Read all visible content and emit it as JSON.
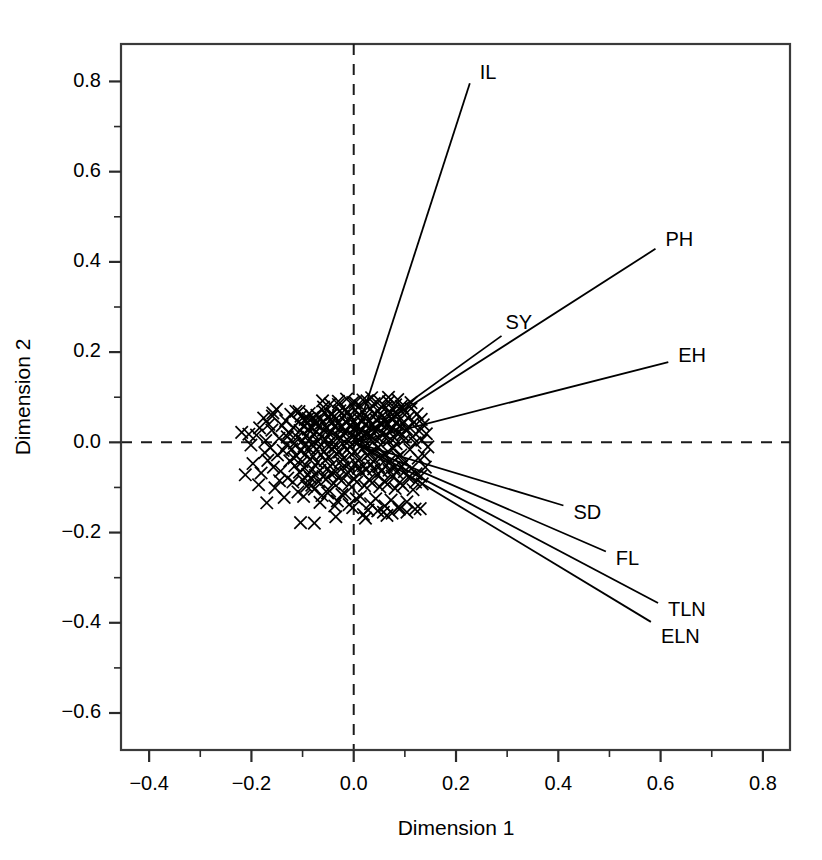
{
  "chart_data": {
    "type": "scatter",
    "title": "",
    "subtitle": "",
    "xlabel": "Dimension 1",
    "ylabel": "Dimension 2",
    "xlim": [
      -0.455,
      0.853
    ],
    "ylim": [
      -0.682,
      0.883
    ],
    "xticks": [
      -0.4,
      -0.2,
      0.0,
      0.2,
      0.4,
      0.6,
      0.8
    ],
    "xticklabels": [
      "-0.4",
      "-0.2",
      "0.0",
      "0.2",
      "0.4",
      "0.6",
      "0.8"
    ],
    "yticks": [
      -0.6,
      -0.4,
      -0.2,
      0.0,
      0.2,
      0.4,
      0.6,
      0.8
    ],
    "yticklabels": [
      "-0.6",
      "-0.4",
      "-0.2",
      "0.0",
      "0.2",
      "0.4",
      "0.6",
      "0.8"
    ],
    "xminorticks": [
      -0.3,
      -0.1,
      0.1,
      0.3,
      0.5,
      0.7
    ],
    "yminorticks": [
      -0.5,
      -0.3,
      -0.1,
      0.1,
      0.3,
      0.5,
      0.7
    ],
    "grid": false,
    "legend": "none",
    "reference_lines": [
      {
        "orientation": "horizontal",
        "value": 0.0,
        "style": "dashed"
      },
      {
        "orientation": "vertical",
        "value": 0.0,
        "style": "dashed"
      }
    ],
    "point_marker": "x",
    "point_color": "#000000",
    "vector_color": "#000000",
    "vectors": [
      {
        "name": "IL",
        "x": 0.227,
        "y": 0.796,
        "label_dx": 10,
        "label_dy": -10
      },
      {
        "name": "PH",
        "x": 0.59,
        "y": 0.429,
        "label_dx": 10,
        "label_dy": -8
      },
      {
        "name": "SY",
        "x": 0.289,
        "y": 0.236,
        "label_dx": 4,
        "label_dy": -12
      },
      {
        "name": "EH",
        "x": 0.615,
        "y": 0.178,
        "label_dx": 10,
        "label_dy": -5
      },
      {
        "name": "SD",
        "x": 0.41,
        "y": -0.14,
        "label_dx": 10,
        "label_dy": 8
      },
      {
        "name": "FL",
        "x": 0.493,
        "y": -0.242,
        "label_dx": 10,
        "label_dy": 8
      },
      {
        "name": "TLN",
        "x": 0.595,
        "y": -0.356,
        "label_dx": 10,
        "label_dy": 8
      },
      {
        "name": "ELN",
        "x": 0.581,
        "y": -0.398,
        "label_dx": 10,
        "label_dy": 16
      }
    ],
    "points": [
      [
        -0.219,
        0.022
      ],
      [
        -0.212,
        -0.072
      ],
      [
        -0.205,
        0.018
      ],
      [
        -0.197,
        -0.047
      ],
      [
        -0.19,
        0.016
      ],
      [
        -0.186,
        -0.094
      ],
      [
        -0.181,
        -0.068
      ],
      [
        -0.176,
        0.054
      ],
      [
        -0.174,
        -0.023
      ],
      [
        -0.17,
        -0.134
      ],
      [
        -0.166,
        0.04
      ],
      [
        -0.163,
        -0.012
      ],
      [
        -0.16,
        0.027
      ],
      [
        -0.157,
        -0.055
      ],
      [
        -0.154,
        -0.101
      ],
      [
        -0.151,
        0.073
      ],
      [
        -0.149,
        -0.028
      ],
      [
        -0.146,
        0.009
      ],
      [
        -0.143,
        -0.064
      ],
      [
        -0.14,
        0.037
      ],
      [
        -0.138,
        -0.018
      ],
      [
        -0.136,
        -0.122
      ],
      [
        -0.133,
        0.048
      ],
      [
        -0.131,
        -0.005
      ],
      [
        -0.129,
        -0.079
      ],
      [
        -0.127,
        0.021
      ],
      [
        -0.125,
        -0.041
      ],
      [
        -0.123,
        0.062
      ],
      [
        -0.121,
        -0.015
      ],
      [
        -0.119,
        -0.088
      ],
      [
        -0.118,
        0.033
      ],
      [
        -0.116,
        -0.002
      ],
      [
        -0.115,
        -0.052
      ],
      [
        -0.113,
        0.069
      ],
      [
        -0.112,
        -0.03
      ],
      [
        -0.11,
        0.011
      ],
      [
        -0.109,
        -0.11
      ],
      [
        -0.108,
        0.045
      ],
      [
        -0.106,
        -0.066
      ],
      [
        -0.105,
        0.026
      ],
      [
        -0.104,
        -0.019
      ],
      [
        -0.103,
        0.058
      ],
      [
        -0.101,
        -0.043
      ],
      [
        -0.1,
        0.004
      ],
      [
        -0.099,
        -0.084
      ],
      [
        -0.098,
        0.036
      ],
      [
        -0.097,
        -0.008
      ],
      [
        -0.096,
        -0.057
      ],
      [
        -0.095,
        0.051
      ],
      [
        -0.094,
        -0.026
      ],
      [
        -0.093,
        0.015
      ],
      [
        -0.092,
        -0.097
      ],
      [
        -0.091,
        0.042
      ],
      [
        -0.09,
        -0.071
      ],
      [
        -0.089,
        0.029
      ],
      [
        -0.088,
        -0.013
      ],
      [
        -0.087,
        0.064
      ],
      [
        -0.086,
        -0.038
      ],
      [
        -0.085,
        0.007
      ],
      [
        -0.084,
        -0.079
      ],
      [
        -0.083,
        0.033
      ],
      [
        -0.082,
        -0.004
      ],
      [
        -0.081,
        -0.06
      ],
      [
        -0.08,
        0.055
      ],
      [
        -0.079,
        -0.031
      ],
      [
        -0.078,
        0.018
      ],
      [
        -0.077,
        -0.104
      ],
      [
        -0.076,
        0.047
      ],
      [
        -0.075,
        -0.073
      ],
      [
        -0.074,
        0.024
      ],
      [
        -0.073,
        -0.016
      ],
      [
        -0.072,
        0.06
      ],
      [
        -0.071,
        -0.045
      ],
      [
        -0.07,
        0.002
      ],
      [
        -0.069,
        -0.087
      ],
      [
        -0.068,
        0.038
      ],
      [
        -0.067,
        -0.01
      ],
      [
        -0.066,
        -0.062
      ],
      [
        -0.065,
        0.053
      ],
      [
        -0.064,
        -0.028
      ],
      [
        -0.063,
        0.013
      ],
      [
        -0.062,
        -0.118
      ],
      [
        -0.061,
        0.044
      ],
      [
        -0.06,
        -0.076
      ],
      [
        -0.059,
        0.027
      ],
      [
        -0.058,
        -0.02
      ],
      [
        -0.057,
        0.067
      ],
      [
        -0.056,
        -0.04
      ],
      [
        -0.055,
        0.006
      ],
      [
        -0.054,
        -0.082
      ],
      [
        -0.053,
        0.031
      ],
      [
        -0.052,
        -0.006
      ],
      [
        -0.051,
        -0.058
      ],
      [
        -0.05,
        0.057
      ],
      [
        -0.049,
        -0.033
      ],
      [
        -0.048,
        0.02
      ],
      [
        -0.047,
        -0.108
      ],
      [
        -0.046,
        0.049
      ],
      [
        -0.045,
        -0.069
      ],
      [
        -0.044,
        0.023
      ],
      [
        -0.043,
        -0.014
      ],
      [
        -0.042,
        0.063
      ],
      [
        -0.041,
        -0.048
      ],
      [
        -0.04,
        0.0
      ],
      [
        -0.039,
        -0.091
      ],
      [
        -0.038,
        0.035
      ],
      [
        -0.037,
        -0.011
      ],
      [
        -0.036,
        -0.065
      ],
      [
        -0.035,
        0.052
      ],
      [
        -0.034,
        -0.025
      ],
      [
        -0.033,
        0.016
      ],
      [
        -0.032,
        -0.13
      ],
      [
        -0.031,
        0.041
      ],
      [
        -0.03,
        -0.078
      ],
      [
        -0.029,
        0.029
      ],
      [
        -0.028,
        -0.022
      ],
      [
        -0.027,
        0.07
      ],
      [
        -0.026,
        -0.043
      ],
      [
        -0.025,
        0.009
      ],
      [
        -0.024,
        -0.085
      ],
      [
        -0.023,
        0.034
      ],
      [
        -0.022,
        -0.003
      ],
      [
        -0.021,
        -0.055
      ],
      [
        -0.02,
        0.059
      ],
      [
        -0.019,
        -0.035
      ],
      [
        -0.018,
        0.022
      ],
      [
        -0.017,
        -0.114
      ],
      [
        -0.016,
        0.046
      ],
      [
        -0.015,
        -0.07
      ],
      [
        -0.014,
        0.025
      ],
      [
        -0.013,
        -0.017
      ],
      [
        -0.012,
        0.065
      ],
      [
        -0.011,
        -0.05
      ],
      [
        -0.01,
        0.003
      ],
      [
        -0.009,
        -0.093
      ],
      [
        -0.008,
        0.037
      ],
      [
        -0.007,
        -0.009
      ],
      [
        -0.006,
        -0.063
      ],
      [
        -0.005,
        0.054
      ],
      [
        -0.004,
        -0.027
      ],
      [
        -0.003,
        0.017
      ],
      [
        -0.002,
        -0.145
      ],
      [
        -0.001,
        0.043
      ],
      [
        0.0,
        -0.08
      ],
      [
        0.001,
        0.031
      ],
      [
        0.002,
        -0.021
      ],
      [
        0.003,
        0.072
      ],
      [
        0.004,
        -0.046
      ],
      [
        0.005,
        0.011
      ],
      [
        0.006,
        -0.088
      ],
      [
        0.007,
        0.036
      ],
      [
        0.008,
        -0.001
      ],
      [
        0.009,
        -0.057
      ],
      [
        0.01,
        0.061
      ],
      [
        0.011,
        -0.037
      ],
      [
        0.012,
        0.024
      ],
      [
        0.013,
        -0.12
      ],
      [
        0.014,
        0.048
      ],
      [
        0.015,
        -0.067
      ],
      [
        0.016,
        0.027
      ],
      [
        0.017,
        -0.015
      ],
      [
        0.018,
        0.067
      ],
      [
        0.019,
        -0.052
      ],
      [
        0.02,
        0.005
      ],
      [
        0.021,
        -0.096
      ],
      [
        0.022,
        0.039
      ],
      [
        0.023,
        -0.007
      ],
      [
        0.024,
        -0.061
      ],
      [
        0.025,
        0.056
      ],
      [
        0.026,
        -0.029
      ],
      [
        0.027,
        0.019
      ],
      [
        0.028,
        -0.15
      ],
      [
        0.029,
        0.045
      ],
      [
        0.03,
        -0.083
      ],
      [
        0.031,
        0.033
      ],
      [
        0.032,
        -0.024
      ],
      [
        0.033,
        0.074
      ],
      [
        0.034,
        -0.049
      ],
      [
        0.035,
        0.013
      ],
      [
        0.036,
        -0.09
      ],
      [
        0.037,
        0.038
      ],
      [
        0.038,
        0.001
      ],
      [
        0.039,
        -0.059
      ],
      [
        0.04,
        0.063
      ],
      [
        0.041,
        -0.039
      ],
      [
        0.042,
        0.026
      ],
      [
        0.043,
        -0.125
      ],
      [
        0.044,
        0.05
      ],
      [
        0.045,
        -0.072
      ],
      [
        0.046,
        0.029
      ],
      [
        0.047,
        -0.012
      ],
      [
        0.048,
        0.069
      ],
      [
        0.049,
        -0.054
      ],
      [
        0.05,
        0.008
      ],
      [
        0.051,
        -0.099
      ],
      [
        0.052,
        0.041
      ],
      [
        0.053,
        -0.005
      ],
      [
        0.054,
        -0.064
      ],
      [
        0.055,
        0.058
      ],
      [
        0.056,
        -0.031
      ],
      [
        0.057,
        0.021
      ],
      [
        0.058,
        -0.155
      ],
      [
        0.059,
        0.047
      ],
      [
        0.06,
        -0.086
      ],
      [
        0.061,
        0.035
      ],
      [
        0.062,
        -0.026
      ],
      [
        0.063,
        0.077
      ],
      [
        0.064,
        -0.051
      ],
      [
        0.065,
        0.015
      ],
      [
        0.066,
        -0.093
      ],
      [
        0.067,
        0.04
      ],
      [
        0.068,
        0.003
      ],
      [
        0.069,
        -0.062
      ],
      [
        0.07,
        0.066
      ],
      [
        0.071,
        -0.041
      ],
      [
        0.072,
        0.028
      ],
      [
        0.073,
        -0.128
      ],
      [
        0.074,
        0.052
      ],
      [
        0.075,
        -0.075
      ],
      [
        0.076,
        0.031
      ],
      [
        0.077,
        -0.014
      ],
      [
        0.078,
        0.072
      ],
      [
        0.079,
        -0.056
      ],
      [
        0.08,
        0.01
      ],
      [
        0.081,
        -0.102
      ],
      [
        0.082,
        0.043
      ],
      [
        0.083,
        -0.003
      ],
      [
        0.084,
        -0.067
      ],
      [
        0.085,
        0.061
      ],
      [
        0.086,
        -0.033
      ],
      [
        0.087,
        0.023
      ],
      [
        0.088,
        -0.143
      ],
      [
        0.089,
        0.049
      ],
      [
        0.09,
        -0.089
      ],
      [
        0.091,
        0.037
      ],
      [
        0.092,
        -0.028
      ],
      [
        0.093,
        0.08
      ],
      [
        0.094,
        -0.053
      ],
      [
        0.095,
        0.017
      ],
      [
        0.096,
        -0.096
      ],
      [
        0.097,
        0.042
      ],
      [
        0.098,
        0.005
      ],
      [
        0.099,
        -0.065
      ],
      [
        0.1,
        0.069
      ],
      [
        0.101,
        -0.044
      ],
      [
        0.103,
        0.03
      ],
      [
        0.104,
        -0.132
      ],
      [
        0.106,
        0.054
      ],
      [
        0.107,
        -0.078
      ],
      [
        0.109,
        0.033
      ],
      [
        0.11,
        -0.016
      ],
      [
        0.112,
        0.075
      ],
      [
        0.113,
        -0.058
      ],
      [
        0.115,
        0.012
      ],
      [
        0.116,
        -0.105
      ],
      [
        0.118,
        0.045
      ],
      [
        0.12,
        -0.001
      ],
      [
        0.122,
        -0.07
      ],
      [
        0.124,
        0.063
      ],
      [
        0.126,
        -0.035
      ],
      [
        0.128,
        0.025
      ],
      [
        0.13,
        -0.147
      ],
      [
        0.132,
        0.051
      ],
      [
        0.134,
        -0.092
      ],
      [
        0.136,
        0.039
      ],
      [
        0.138,
        -0.03
      ],
      [
        0.14,
        -0.055
      ],
      [
        0.142,
        0.019
      ],
      [
        -0.201,
        -0.006
      ],
      [
        -0.184,
        0.032
      ],
      [
        -0.168,
        -0.04
      ],
      [
        -0.159,
        0.058
      ],
      [
        -0.145,
        -0.085
      ],
      [
        -0.13,
        0.012
      ],
      [
        -0.117,
        -0.035
      ],
      [
        -0.107,
        0.068
      ],
      [
        -0.098,
        -0.12
      ],
      [
        -0.089,
        0.053
      ],
      [
        -0.082,
        -0.095
      ],
      [
        -0.074,
        0.04
      ],
      [
        -0.066,
        -0.133
      ],
      [
        -0.059,
        0.078
      ],
      [
        -0.051,
        -0.112
      ],
      [
        -0.044,
        0.061
      ],
      [
        -0.037,
        -0.141
      ],
      [
        -0.03,
        0.084
      ],
      [
        -0.023,
        -0.116
      ],
      [
        -0.016,
        0.073
      ],
      [
        -0.009,
        -0.138
      ],
      [
        -0.002,
        0.088
      ],
      [
        0.005,
        -0.125
      ],
      [
        0.012,
        0.081
      ],
      [
        0.019,
        -0.16
      ],
      [
        0.026,
        0.092
      ],
      [
        0.033,
        -0.136
      ],
      [
        0.04,
        0.086
      ],
      [
        0.047,
        -0.152
      ],
      [
        0.054,
        0.079
      ],
      [
        0.061,
        -0.141
      ],
      [
        0.068,
        0.09
      ],
      [
        0.075,
        -0.157
      ],
      [
        0.082,
        0.083
      ],
      [
        0.089,
        -0.148
      ],
      [
        0.096,
        0.076
      ],
      [
        -0.104,
        -0.178
      ],
      [
        -0.077,
        -0.179
      ],
      [
        -0.035,
        -0.165
      ],
      [
        0.023,
        -0.168
      ],
      [
        0.065,
        -0.162
      ],
      [
        0.104,
        -0.155
      ],
      [
        0.12,
        -0.148
      ],
      [
        0.133,
        0.005
      ],
      [
        0.145,
        -0.01
      ],
      [
        0.121,
        -0.088
      ],
      [
        0.131,
        -0.075
      ],
      [
        0.112,
        0.088
      ],
      [
        0.086,
        0.095
      ],
      [
        0.068,
        0.1
      ],
      [
        0.05,
        0.092
      ],
      [
        0.035,
        0.099
      ],
      [
        0.018,
        0.094
      ],
      [
        0.003,
        0.088
      ],
      [
        -0.014,
        0.096
      ],
      [
        -0.03,
        0.091
      ],
      [
        -0.046,
        0.085
      ],
      [
        -0.061,
        0.092
      ],
      [
        -0.158,
        0.065
      ],
      [
        -0.172,
        0.004
      ]
    ]
  }
}
